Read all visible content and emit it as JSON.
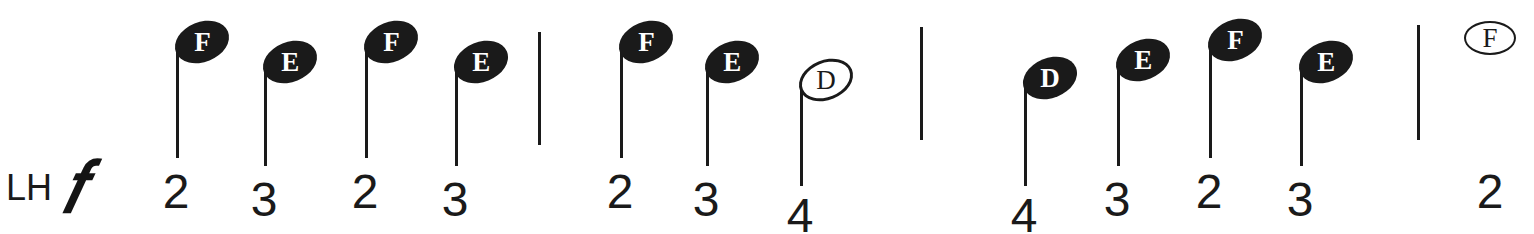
{
  "page": {
    "background_color": "#ffffff",
    "ink_color": "#1a1a1a",
    "width": 1534,
    "height": 234
  },
  "hand_label": {
    "text": "LH",
    "x": 6,
    "y": 170
  },
  "dynamic": {
    "text": "𝑓",
    "name": "forte",
    "x": 62,
    "y": 152
  },
  "notation": {
    "type": "pre-staff-piano-notation",
    "pitch_rows": {
      "F": 42,
      "E": 62,
      "D": 78
    },
    "notes": [
      {
        "letter": "F",
        "finger": "2",
        "head": "filled",
        "stem": true,
        "x": 176,
        "head_cy": 42,
        "stem_bottom": 158,
        "finger_y": 168
      },
      {
        "letter": "E",
        "finger": "3",
        "head": "filled",
        "stem": true,
        "x": 264,
        "head_cy": 62,
        "stem_bottom": 166,
        "finger_y": 176
      },
      {
        "letter": "F",
        "finger": "2",
        "head": "filled",
        "stem": true,
        "x": 365,
        "head_cy": 42,
        "stem_bottom": 158,
        "finger_y": 168
      },
      {
        "letter": "E",
        "finger": "3",
        "head": "filled",
        "stem": true,
        "x": 455,
        "head_cy": 62,
        "stem_bottom": 166,
        "finger_y": 176
      },
      {
        "letter": "F",
        "finger": "2",
        "head": "filled",
        "stem": true,
        "x": 620,
        "head_cy": 42,
        "stem_bottom": 158,
        "finger_y": 168
      },
      {
        "letter": "E",
        "finger": "3",
        "head": "filled",
        "stem": true,
        "x": 706,
        "head_cy": 62,
        "stem_bottom": 166,
        "finger_y": 176
      },
      {
        "letter": "D",
        "finger": "4",
        "head": "open",
        "stem": true,
        "x": 800,
        "head_cy": 80,
        "stem_bottom": 186,
        "finger_y": 192
      },
      {
        "letter": "D",
        "finger": "4",
        "head": "filled",
        "stem": true,
        "x": 1024,
        "head_cy": 78,
        "stem_bottom": 186,
        "finger_y": 192
      },
      {
        "letter": "E",
        "finger": "3",
        "head": "filled",
        "stem": true,
        "x": 1117,
        "head_cy": 60,
        "stem_bottom": 166,
        "finger_y": 176
      },
      {
        "letter": "F",
        "finger": "2",
        "head": "filled",
        "stem": true,
        "x": 1209,
        "head_cy": 40,
        "stem_bottom": 158,
        "finger_y": 168
      },
      {
        "letter": "E",
        "finger": "3",
        "head": "filled",
        "stem": true,
        "x": 1300,
        "head_cy": 62,
        "stem_bottom": 166,
        "finger_y": 176
      },
      {
        "letter": "F",
        "finger": "2",
        "head": "open-flat",
        "stem": false,
        "x": 1490,
        "head_cy": 38,
        "stem_bottom": 0,
        "finger_y": 168
      }
    ],
    "barlines": [
      {
        "x": 538,
        "y_top": 32,
        "y_bottom": 145
      },
      {
        "x": 920,
        "y_top": 27,
        "y_bottom": 140
      },
      {
        "x": 1417,
        "y_top": 25,
        "y_bottom": 140
      }
    ]
  }
}
